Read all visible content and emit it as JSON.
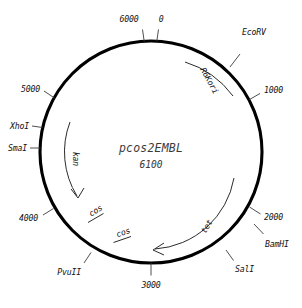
{
  "diagram": {
    "type": "plasmid-map",
    "plasmid_name": "pcos2EMBL",
    "plasmid_size": "6100",
    "circle": {
      "cx": 151,
      "cy": 152,
      "r": 111
    },
    "ticks": [
      {
        "label": "0",
        "position_bp": 0,
        "angle_deg": 3
      },
      {
        "label": "1000",
        "position_bp": 1000,
        "angle_deg": 62
      },
      {
        "label": "2000",
        "position_bp": 2000,
        "angle_deg": 120
      },
      {
        "label": "3000",
        "position_bp": 3000,
        "angle_deg": 180
      },
      {
        "label": "4000",
        "position_bp": 4000,
        "angle_deg": 239
      },
      {
        "label": "5000",
        "position_bp": 5000,
        "angle_deg": 301
      },
      {
        "label": "6000",
        "position_bp": 6000,
        "angle_deg": 352
      }
    ],
    "restriction_sites": [
      {
        "label": "EcoRV",
        "angle_deg": 30
      },
      {
        "label": "BamHI",
        "angle_deg": 131
      },
      {
        "label": "SalI",
        "angle_deg": 152
      },
      {
        "label": "PvuII",
        "angle_deg": 219
      },
      {
        "label": "SmaI",
        "angle_deg": 271
      },
      {
        "label": "XhoI",
        "angle_deg": 285
      }
    ],
    "features": [
      {
        "label": "R6Kori",
        "kind": "origin",
        "angle_deg": 42
      },
      {
        "label": "tet",
        "kind": "gene-arrow",
        "direction": "counter-clockwise"
      },
      {
        "label": "kan",
        "kind": "gene-arrow",
        "direction": "clockwise"
      },
      {
        "label": "cos",
        "kind": "site-bar"
      },
      {
        "label": "cos",
        "kind": "site-bar"
      }
    ],
    "colors": {
      "backbone": "#000000",
      "text": "#111111",
      "title": "#3a3a3a",
      "leader": "#3b3b3b",
      "background": "#ffffff"
    }
  }
}
